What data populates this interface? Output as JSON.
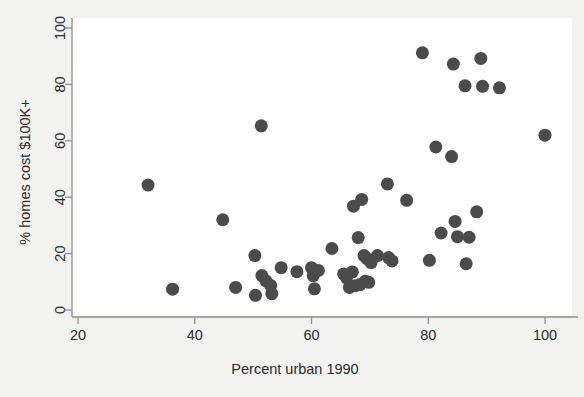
{
  "chart_data": {
    "type": "scatter",
    "title": "",
    "xlabel": "Percent urban 1990",
    "ylabel": "% homes cost $100K+",
    "xlim": [
      20,
      100
    ],
    "ylim": [
      0,
      100
    ],
    "xticks": [
      20,
      40,
      60,
      80,
      100
    ],
    "yticks": [
      0,
      20,
      40,
      60,
      80,
      100
    ],
    "xtick_labels": [
      "20",
      "40",
      "60",
      "80",
      "100"
    ],
    "ytick_labels": [
      "0",
      "20",
      "40",
      "60",
      "80",
      "100"
    ],
    "grid": false,
    "legend": false,
    "marker": {
      "shape": "circle",
      "color": "#4b4b4b",
      "size": 9
    },
    "axis_color": "#8f8f8f",
    "background_color": "#f2f2f0",
    "plot_background_color": "#ffffff",
    "n_points": 50,
    "points": [
      {
        "x": 32.0,
        "y": 44.3
      },
      {
        "x": 36.2,
        "y": 7.4
      },
      {
        "x": 44.8,
        "y": 32.0
      },
      {
        "x": 47.0,
        "y": 8.0
      },
      {
        "x": 50.3,
        "y": 19.3
      },
      {
        "x": 50.4,
        "y": 5.2
      },
      {
        "x": 51.4,
        "y": 65.3
      },
      {
        "x": 51.5,
        "y": 12.2
      },
      {
        "x": 52.2,
        "y": 10.3
      },
      {
        "x": 53.0,
        "y": 8.7
      },
      {
        "x": 53.2,
        "y": 5.8
      },
      {
        "x": 54.8,
        "y": 15.0
      },
      {
        "x": 57.5,
        "y": 13.6
      },
      {
        "x": 60.0,
        "y": 15.0
      },
      {
        "x": 60.3,
        "y": 12.2
      },
      {
        "x": 60.5,
        "y": 7.5
      },
      {
        "x": 61.2,
        "y": 14.0
      },
      {
        "x": 63.5,
        "y": 21.8
      },
      {
        "x": 65.5,
        "y": 12.8
      },
      {
        "x": 66.0,
        "y": 11.4
      },
      {
        "x": 66.5,
        "y": 8.0
      },
      {
        "x": 67.0,
        "y": 13.5
      },
      {
        "x": 67.2,
        "y": 36.8
      },
      {
        "x": 67.5,
        "y": 8.6
      },
      {
        "x": 68.0,
        "y": 25.7
      },
      {
        "x": 68.3,
        "y": 9.0
      },
      {
        "x": 68.6,
        "y": 39.2
      },
      {
        "x": 69.0,
        "y": 19.3
      },
      {
        "x": 69.2,
        "y": 10.2
      },
      {
        "x": 69.5,
        "y": 18.2
      },
      {
        "x": 69.8,
        "y": 9.8
      },
      {
        "x": 70.2,
        "y": 16.8
      },
      {
        "x": 71.3,
        "y": 19.3
      },
      {
        "x": 73.0,
        "y": 44.7
      },
      {
        "x": 73.2,
        "y": 18.6
      },
      {
        "x": 73.8,
        "y": 17.4
      },
      {
        "x": 76.3,
        "y": 38.9
      },
      {
        "x": 79.0,
        "y": 91.2
      },
      {
        "x": 80.2,
        "y": 17.6
      },
      {
        "x": 81.3,
        "y": 57.8
      },
      {
        "x": 82.2,
        "y": 27.3
      },
      {
        "x": 84.0,
        "y": 54.4
      },
      {
        "x": 84.3,
        "y": 87.2
      },
      {
        "x": 84.6,
        "y": 31.4
      },
      {
        "x": 85.0,
        "y": 26.0
      },
      {
        "x": 86.3,
        "y": 79.5
      },
      {
        "x": 86.5,
        "y": 16.4
      },
      {
        "x": 87.0,
        "y": 25.8
      },
      {
        "x": 88.3,
        "y": 34.8
      },
      {
        "x": 89.0,
        "y": 89.2
      },
      {
        "x": 89.3,
        "y": 79.3
      },
      {
        "x": 92.2,
        "y": 78.8
      },
      {
        "x": 100.0,
        "y": 62.0
      }
    ]
  }
}
